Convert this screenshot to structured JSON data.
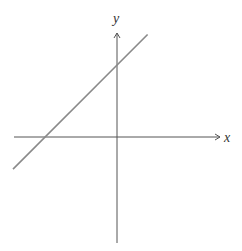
{
  "chart_data": {
    "type": "line",
    "title": "",
    "xlabel": "x",
    "ylabel": "y",
    "xlim": [
      -1.4,
      1.4
    ],
    "ylim": [
      -1.4,
      1.0
    ],
    "grid": false,
    "ticks": false,
    "series": [
      {
        "name": "y = x + b (b > 0)",
        "x": [
          -1.36,
          0.4
        ],
        "y": [
          -0.42,
          1.34
        ]
      }
    ],
    "annotations": {
      "x_intercept": -0.98,
      "y_intercept": 0.96
    },
    "colors": {
      "axis": "#555555",
      "line": "#8a8a8a"
    }
  }
}
